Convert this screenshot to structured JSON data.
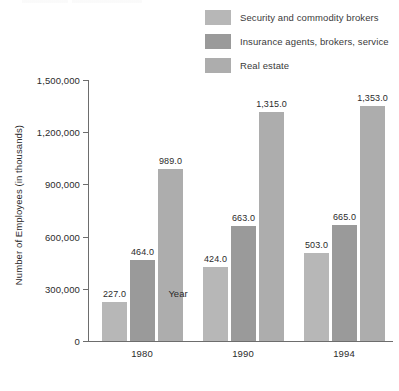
{
  "chart_data": {
    "type": "bar",
    "title": "",
    "xlabel": "Year",
    "ylabel": "Number of Employees (in thousands)",
    "categories": [
      "1980",
      "1990",
      "1994"
    ],
    "series": [
      {
        "name": "Security and commodity brokers",
        "color": "#b7b7b7",
        "values": [
          227.0,
          424.0,
          503.0
        ],
        "labels": [
          "227.0",
          "424.0",
          "503.0"
        ]
      },
      {
        "name": "Insurance agents, brokers, service",
        "color": "#9a9a9a",
        "values": [
          464.0,
          663.0,
          665.0
        ],
        "labels": [
          "464.0",
          "663.0",
          "665.0"
        ]
      },
      {
        "name": "Real estate",
        "color": "#adadad",
        "values": [
          989.0,
          1315.0,
          1353.0
        ],
        "labels": [
          "989.0",
          "1,315.0",
          "1,353.0"
        ]
      }
    ],
    "ylim": [
      0,
      1500
    ],
    "ytick_values": [
      0,
      300,
      600,
      900,
      1200,
      1500
    ],
    "ytick_labels": [
      "0",
      "300,000",
      "600,000",
      "900,000",
      "1,200,000",
      "1,500,000"
    ],
    "grid": false,
    "legend_position": "top-right"
  },
  "legend": {
    "items": [
      {
        "label": "Security and commodity brokers",
        "color": "#b7b7b7"
      },
      {
        "label": "Insurance agents, brokers, service",
        "color": "#9a9a9a"
      },
      {
        "label": "Real estate",
        "color": "#adadad"
      }
    ]
  },
  "axes": {
    "x_title": "Year",
    "y_title": "Number of Employees (in thousands)",
    "x_tick_labels": [
      "1980",
      "1990",
      "1994"
    ],
    "y_tick_labels": [
      "1,500,000",
      "1,200,000",
      "900,000",
      "600,000",
      "300,000",
      "0"
    ]
  },
  "colors": {
    "axis": "#6d6d6d",
    "text": "#2b2b2b",
    "background": "#ffffff"
  }
}
